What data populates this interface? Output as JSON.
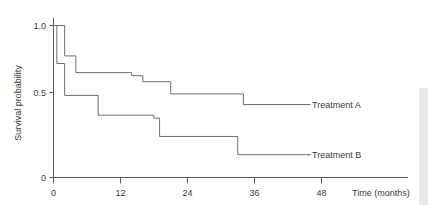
{
  "chart_data": {
    "type": "line",
    "title": "",
    "subtitle": "",
    "xlabel": "Time (months)",
    "ylabel": "Survival probability",
    "xlim": [
      0,
      50
    ],
    "ylim": [
      0,
      1.05
    ],
    "xticks": [
      0,
      12,
      24,
      36,
      48
    ],
    "xtick_labels": [
      "0",
      "12",
      "24",
      "36",
      "48"
    ],
    "yticks": [
      0,
      0.5,
      1.0
    ],
    "ytick_labels": [
      "0",
      "0.5",
      "1.0"
    ],
    "grid": false,
    "legend_position": "right-inline-annotation",
    "step_style": "post",
    "series": [
      {
        "name": "Treatment A",
        "label": "Treatment A",
        "color": "#6e6e70",
        "x": [
          0,
          2,
          4,
          14,
          16,
          21,
          34,
          46
        ],
        "y": [
          1.0,
          0.8,
          0.69,
          0.67,
          0.63,
          0.55,
          0.48,
          0.48
        ],
        "annotation_x": 46,
        "annotation_y": 0.48
      },
      {
        "name": "Treatment B",
        "label": "Treatment B",
        "color": "#6e6e70",
        "x": [
          0,
          0.6,
          2,
          8,
          18,
          19,
          33,
          46
        ],
        "y": [
          1.0,
          0.75,
          0.54,
          0.41,
          0.39,
          0.27,
          0.15,
          0.15
        ],
        "annotation_x": 46,
        "annotation_y": 0.15
      }
    ]
  },
  "axes": {
    "y_axis_title": "Survival probability",
    "x_axis_title": "Time (months)",
    "y_tick_1": "1.0",
    "y_tick_2": "0.5",
    "y_tick_3": "0",
    "x_tick_1": "0",
    "x_tick_2": "12",
    "x_tick_3": "24",
    "x_tick_4": "36",
    "x_tick_5": "48"
  },
  "annotations": {
    "series_a_label": "Treatment A",
    "series_b_label": "Treatment B"
  },
  "colors": {
    "line": "#6e6e70",
    "axis": "#58585a",
    "text": "#3a3a3a",
    "background": "#ffffff"
  }
}
